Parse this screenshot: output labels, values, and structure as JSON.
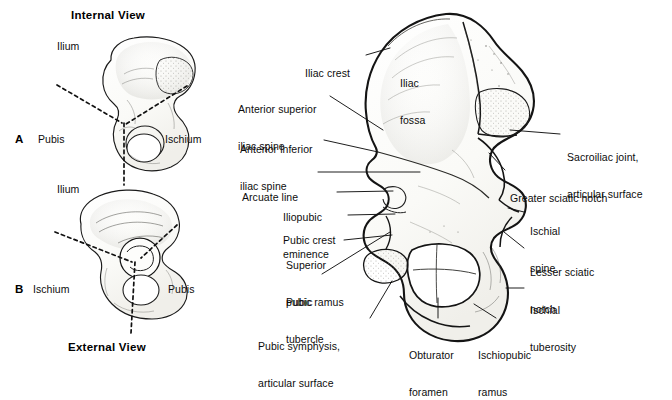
{
  "figure": {
    "title_top": "Internal View",
    "title_bottom": "External View",
    "background": "#ffffff",
    "ink": "#0d0d0d",
    "bone_fill": "#fbfbf9",
    "shade": "#9a9a96"
  },
  "panels": [
    {
      "letter": "A",
      "view": "Internal View",
      "labels": [
        {
          "id": "ilium-a",
          "text": "Ilium",
          "x": 57,
          "y": 46
        },
        {
          "id": "pubis-a",
          "text": "Pubis",
          "x": 38,
          "y": 139
        },
        {
          "id": "ischium-a",
          "text": "Ischium",
          "x": 165,
          "y": 139
        }
      ]
    },
    {
      "letter": "B",
      "view": "External View",
      "labels": [
        {
          "id": "ilium-b",
          "text": "Ilium",
          "x": 57,
          "y": 189
        },
        {
          "id": "ischium-b",
          "text": "Ischium",
          "x": 33,
          "y": 289
        },
        {
          "id": "pubis-b",
          "text": "Pubis",
          "x": 168,
          "y": 289
        }
      ]
    }
  ],
  "main_figure": {
    "inline_labels": [
      {
        "id": "iliac-fossa",
        "line1": "Iliac",
        "line2": "fossa",
        "x": 400,
        "y": 58
      }
    ],
    "left_labels": [
      {
        "id": "iliac-crest",
        "lines": [
          "Iliac crest"
        ],
        "x": 305,
        "y": 48,
        "align": "left"
      },
      {
        "id": "anterior-superior-iliac-spine",
        "lines": [
          "Anterior superior",
          "iliac spine"
        ],
        "x": 238,
        "y": 84,
        "align": "left"
      },
      {
        "id": "anterior-inferior-iliac-spine",
        "lines": [
          "Anterior inferior",
          "iliac spine"
        ],
        "x": 240,
        "y": 124,
        "align": "left"
      },
      {
        "id": "arcuate-line",
        "lines": [
          "Arcuate line"
        ],
        "x": 242,
        "y": 168,
        "align": "left"
      },
      {
        "id": "iliopubic-eminence",
        "lines": [
          "Iliopubic",
          "eminence"
        ],
        "x": 283,
        "y": 187,
        "align": "left"
      },
      {
        "id": "pubic-crest",
        "lines": [
          "Pubic crest"
        ],
        "x": 283,
        "y": 211,
        "align": "left"
      },
      {
        "id": "superior-pubic-ramus",
        "lines": [
          "Superior",
          "pubic ramus"
        ],
        "x": 286,
        "y": 237,
        "align": "left"
      },
      {
        "id": "pubic-tubercle",
        "lines": [
          "Pubic",
          "tubercle"
        ],
        "x": 286,
        "y": 277,
        "align": "left"
      },
      {
        "id": "pubic-symphysis",
        "lines": [
          "Pubic symphysis,",
          "articular surface"
        ],
        "x": 258,
        "y": 320,
        "align": "left"
      }
    ],
    "right_labels": [
      {
        "id": "sacroiliac-joint",
        "lines": [
          "Sacroiliac joint,",
          "articular surface"
        ],
        "x": 567,
        "y": 131,
        "align": "left"
      },
      {
        "id": "greater-sciatic-notch",
        "lines": [
          "Greater sciatic notch"
        ],
        "x": 510,
        "y": 173,
        "align": "left"
      },
      {
        "id": "ischial-spine",
        "lines": [
          "Ischial",
          "spine"
        ],
        "x": 530,
        "y": 202,
        "align": "left"
      },
      {
        "id": "lesser-sciatic-notch",
        "lines": [
          "Lesser sciatic",
          "notch"
        ],
        "x": 530,
        "y": 242,
        "align": "left"
      },
      {
        "id": "ischial-tuberosity",
        "lines": [
          "Ischial",
          "tuberosity"
        ],
        "x": 530,
        "y": 279,
        "align": "left"
      }
    ],
    "bottom_labels": [
      {
        "id": "obturator-foramen",
        "lines": [
          "Obturator",
          "foramen"
        ],
        "x": 409,
        "y": 326,
        "align": "left"
      },
      {
        "id": "ischiopubic-ramus",
        "lines": [
          "Ischiopubic",
          "ramus"
        ],
        "x": 478,
        "y": 326,
        "align": "left"
      }
    ]
  }
}
